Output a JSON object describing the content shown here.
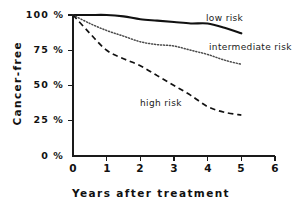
{
  "chart_data": {
    "type": "line",
    "title": "",
    "xlabel": "Years after treatment",
    "ylabel": "Cancer-free",
    "xlim": [
      0,
      6
    ],
    "ylim": [
      0,
      100
    ],
    "xticks": [
      "0",
      "1",
      "2",
      "3",
      "4",
      "5",
      "6"
    ],
    "yticks": [
      "100 %",
      "75 %",
      "50 %",
      "25 %",
      "0 %"
    ],
    "ytick_values": [
      100,
      75,
      50,
      25,
      0
    ],
    "grid": false,
    "legend_position": "inline-annotations",
    "x": [
      0,
      0.5,
      1,
      1.5,
      2,
      2.5,
      3,
      3.5,
      4,
      4.5,
      5
    ],
    "series": [
      {
        "name": "low risk",
        "style": "solid",
        "color": "#111111",
        "values": [
          100,
          100,
          100,
          99,
          97,
          96,
          95,
          94,
          94,
          91,
          87
        ]
      },
      {
        "name": "intermediate risk",
        "style": "dotted",
        "color": "#4a4a4a",
        "values": [
          100,
          94,
          89,
          85,
          81,
          79,
          78,
          75,
          72,
          68,
          65
        ]
      },
      {
        "name": "high risk",
        "style": "dashed",
        "color": "#111111",
        "values": [
          100,
          87,
          75,
          69,
          64,
          57,
          50,
          43,
          35,
          31,
          29
        ]
      }
    ],
    "annotations": [
      {
        "text": "low risk",
        "x": 4.05,
        "y": 95
      },
      {
        "text": "intermediate risk",
        "x": 4.15,
        "y": 73
      },
      {
        "text": "high risk",
        "x": 2.05,
        "y": 43
      }
    ]
  },
  "axis": {
    "x_title": "Years after treatment",
    "y_title": "Cancer-free"
  },
  "ticks": {
    "y": [
      {
        "label": "100 %",
        "value": 100
      },
      {
        "label": "75 %",
        "value": 75
      },
      {
        "label": "50 %",
        "value": 50
      },
      {
        "label": "25 %",
        "value": 25
      },
      {
        "label": "0 %",
        "value": 0
      }
    ],
    "x": [
      {
        "label": "0",
        "value": 0
      },
      {
        "label": "1",
        "value": 1
      },
      {
        "label": "2",
        "value": 2
      },
      {
        "label": "3",
        "value": 3
      },
      {
        "label": "4",
        "value": 4
      },
      {
        "label": "5",
        "value": 5
      },
      {
        "label": "6",
        "value": 6
      }
    ]
  },
  "labels": {
    "low": "low risk",
    "intermediate": "intermediate risk",
    "high": "high risk"
  }
}
